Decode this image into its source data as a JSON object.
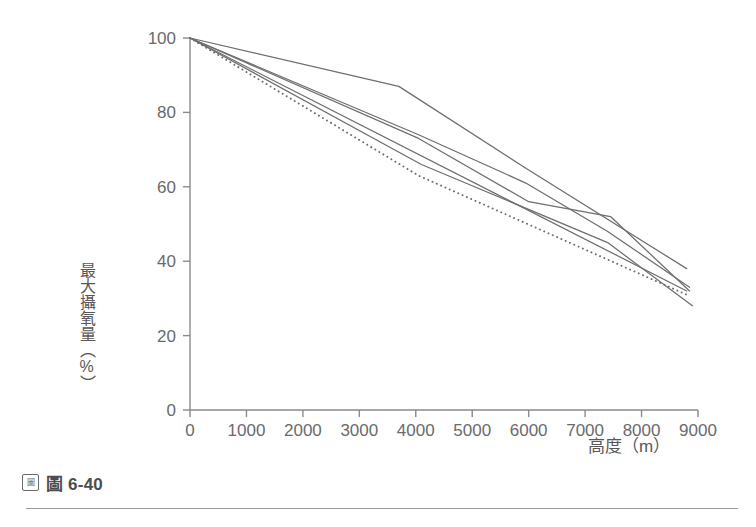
{
  "figure": {
    "caption_icon": "figure-glyph-icon",
    "caption_label": "圖 6-40"
  },
  "axes": {
    "x_title": "高度（m）",
    "y_title": "最大攝氧量（%）",
    "x_ticks": [
      "0",
      "1000",
      "2000",
      "3000",
      "4000",
      "5000",
      "6000",
      "7000",
      "8000",
      "9000"
    ],
    "y_ticks": [
      "0",
      "20",
      "40",
      "60",
      "80",
      "100"
    ]
  },
  "chart_data": {
    "type": "line",
    "title": "圖 6-40",
    "xlabel": "高度（m）",
    "ylabel": "最大攝氧量（%）",
    "xlim": [
      0,
      9000
    ],
    "ylim": [
      0,
      100
    ],
    "xtick_values": [
      0,
      1000,
      2000,
      3000,
      4000,
      5000,
      6000,
      7000,
      8000,
      9000
    ],
    "ytick_values": [
      0,
      20,
      40,
      60,
      80,
      100
    ],
    "grid": false,
    "legend": "none",
    "line_color": "#6e6e70",
    "series": [
      {
        "name": "series-1",
        "style": "solid",
        "x": [
          0,
          3700,
          5950,
          8800
        ],
        "y": [
          100,
          87,
          65,
          38
        ]
      },
      {
        "name": "series-2",
        "style": "solid",
        "x": [
          0,
          4050,
          5950,
          7400,
          8850
        ],
        "y": [
          100,
          74,
          61,
          48,
          33
        ]
      },
      {
        "name": "series-3",
        "style": "solid",
        "x": [
          0,
          4050,
          6000,
          7450,
          8850
        ],
        "y": [
          100,
          73,
          56,
          52,
          32
        ]
      },
      {
        "name": "series-4",
        "style": "solid",
        "x": [
          0,
          4100,
          7400,
          8900
        ],
        "y": [
          100,
          66,
          45,
          28
        ]
      },
      {
        "name": "series-5",
        "style": "solid",
        "x": [
          0,
          8800
        ],
        "y": [
          100,
          32
        ]
      },
      {
        "name": "series-6",
        "style": "dotted",
        "x": [
          0,
          4050,
          8800
        ],
        "y": [
          100,
          63,
          31
        ]
      }
    ]
  },
  "geometry": {
    "plot_left": 190,
    "plot_right": 698,
    "plot_top": 38,
    "plot_bottom": 410
  }
}
